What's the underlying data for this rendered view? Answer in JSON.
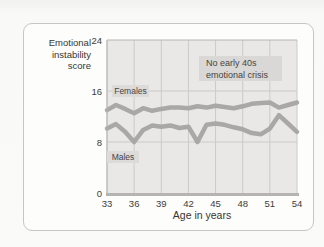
{
  "chart_data": {
    "type": "line",
    "ylabel": "Emotional\ninstability\nscore",
    "xlabel": "Age in years",
    "annotation": "No early 40s\nemotional crisis",
    "xlim": [
      33,
      54
    ],
    "ylim": [
      0,
      24
    ],
    "x_ticks": [
      33,
      36,
      39,
      42,
      45,
      48,
      51,
      54
    ],
    "y_ticks": [
      0,
      8,
      16,
      24
    ],
    "grid": true,
    "legend": "inline-labels",
    "x": [
      33,
      34,
      35,
      36,
      37,
      38,
      39,
      40,
      41,
      42,
      43,
      44,
      45,
      46,
      47,
      48,
      49,
      50,
      51,
      52,
      53,
      54
    ],
    "series": [
      {
        "name": "Females",
        "values": [
          13.0,
          13.8,
          13.2,
          12.5,
          13.3,
          12.9,
          13.2,
          13.4,
          13.4,
          13.3,
          13.6,
          13.4,
          13.7,
          13.5,
          13.3,
          13.6,
          14.0,
          14.1,
          14.2,
          13.4,
          13.8,
          14.2
        ]
      },
      {
        "name": "Males",
        "values": [
          10.1,
          10.8,
          9.6,
          8.0,
          9.9,
          10.6,
          10.4,
          10.6,
          10.2,
          10.4,
          8.0,
          10.7,
          10.9,
          10.7,
          10.3,
          10.0,
          9.4,
          9.2,
          10.1,
          12.2,
          10.9,
          9.6
        ]
      }
    ]
  },
  "colors": {
    "page_bg": "#fafaf8",
    "panel_bg": "#fdfdfb",
    "panel_border": "#c7c6c4",
    "plot_bg": "#e9e8e6",
    "grid": "#cbcac8",
    "axis": "#b5b4b2",
    "line": "#a9a8a6",
    "label_box_bg": "#dcdbd9",
    "text": "#3d3c3a"
  }
}
